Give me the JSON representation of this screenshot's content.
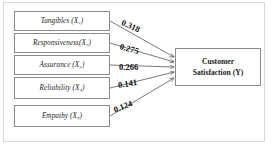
{
  "diagram": {
    "type": "path-diagram",
    "outcome": {
      "line1": "Customer",
      "line2": "Satisfaction (Y)"
    },
    "predictors": [
      {
        "name": "Tangibles",
        "symbol": "X",
        "subscript": "1",
        "label": "Tangibles (X₁)"
      },
      {
        "name": "Responsiveness",
        "symbol": "X",
        "subscript": "2",
        "label": "Responsiveness(X₂)"
      },
      {
        "name": "Assurance",
        "symbol": "X",
        "subscript": "3",
        "label": "Assurance (X₃)"
      },
      {
        "name": "Reliability",
        "symbol": "X",
        "subscript": "4",
        "label": "Reliability (X₄)"
      },
      {
        "name": "Empathy",
        "symbol": "X",
        "subscript": "5",
        "label": "Empathy (X₅)"
      }
    ],
    "paths": [
      {
        "from": "Tangibles (X₁)",
        "to": "Customer Satisfaction (Y)",
        "coefficient": "0.318"
      },
      {
        "from": "Responsiveness(X₂)",
        "to": "Customer Satisfaction (Y)",
        "coefficient": "0.275"
      },
      {
        "from": "Assurance (X₃)",
        "to": "Customer Satisfaction (Y)",
        "coefficient": "0.266"
      },
      {
        "from": "Reliability (X₄)",
        "to": "Customer Satisfaction (Y)",
        "coefficient": "0.141"
      },
      {
        "from": "Empathy (X₅)",
        "to": "Customer Satisfaction (Y)",
        "coefficient": "0.124"
      }
    ],
    "colors": {
      "box_border": "#8a8a8a",
      "frame": "#d8d8d8",
      "line": "#555555",
      "text": "#1a1a1a"
    }
  }
}
